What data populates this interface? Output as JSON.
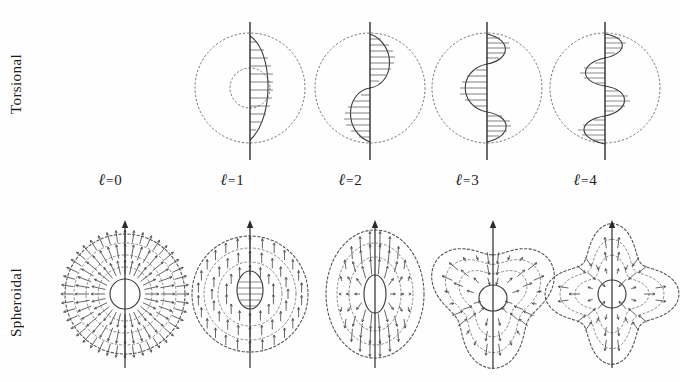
{
  "figure": {
    "background_color": "#fefefe",
    "ink_color": "#333333",
    "dotted_color": "#777777",
    "axis_color": "#2b2b2b"
  },
  "rows": [
    {
      "key": "torsional",
      "label": "Torsional"
    },
    {
      "key": "spheroidal",
      "label": "Spheroidal"
    }
  ],
  "columns": [
    {
      "key": "l0",
      "ell": "ℓ",
      "eq": "=",
      "value": "0",
      "label": "ℓ = 0"
    },
    {
      "key": "l1",
      "ell": "ℓ",
      "eq": "=",
      "value": "1",
      "label": "ℓ = 1"
    },
    {
      "key": "l2",
      "ell": "ℓ",
      "eq": "=",
      "value": "2",
      "label": "ℓ = 2"
    },
    {
      "key": "l3",
      "ell": "ℓ",
      "eq": "=",
      "value": "3",
      "label": "ℓ = 3"
    },
    {
      "key": "l4",
      "ell": "ℓ",
      "eq": "=",
      "value": "4",
      "label": "ℓ = 4"
    }
  ],
  "chart_data": {
    "type": "diagram",
    "categories": [
      "ℓ = 0",
      "ℓ = 1",
      "ℓ = 2",
      "ℓ = 3",
      "ℓ = 4"
    ],
    "series": [
      {
        "name": "Torsional",
        "lobe_counts": [
          0,
          1,
          2,
          3,
          4
        ],
        "notes": [
          "no torsional mode exists for ℓ = 0 (panel empty)",
          "single hatched lobe on the right of the axis",
          "two hatched lobes: right above, left below",
          "three hatched lobes alternating right, left, right",
          "four hatched lobes alternating right, left, right, left"
        ]
      },
      {
        "name": "Spheroidal",
        "lobe_counts": [
          0,
          1,
          2,
          3,
          4
        ],
        "notes": [
          "radial breathing mode, arrows point outward from the core",
          "translational mode, all arrows point along the axis",
          "prolate football shape, arrows converge toward the poles",
          "three-lobed pear shape",
          "four-lobed diamond shape"
        ]
      }
    ],
    "legend": [],
    "xlabel": "angular order ℓ",
    "ylabel": "",
    "grid": false
  }
}
